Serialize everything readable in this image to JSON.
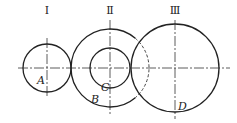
{
  "diagram": {
    "type": "gear-train-circles",
    "stroke_color": "#222222",
    "background": "#ffffff",
    "center_line_y": 68,
    "axes": [
      {
        "id": "I",
        "label": "Ⅰ",
        "cx": 47,
        "label_y": 14
      },
      {
        "id": "II",
        "label": "Ⅱ",
        "cx": 110,
        "label_y": 14
      },
      {
        "id": "III",
        "label": "Ⅲ",
        "cx": 175,
        "label_y": 14
      }
    ],
    "circles": [
      {
        "name": "A",
        "label": "A",
        "cx": 47,
        "cy": 68,
        "r": 24,
        "label_x": 37,
        "label_y": 84
      },
      {
        "name": "B",
        "label": "B",
        "cx": 110,
        "cy": 68,
        "r": 39,
        "label_x": 93,
        "label_y": 103
      },
      {
        "name": "C",
        "label": "C",
        "cx": 110,
        "cy": 68,
        "r": 20,
        "label_x": 101,
        "label_y": 91
      },
      {
        "name": "D",
        "label": "D",
        "cx": 175,
        "cy": 68,
        "r": 44,
        "label_x": 178,
        "label_y": 109
      }
    ]
  }
}
